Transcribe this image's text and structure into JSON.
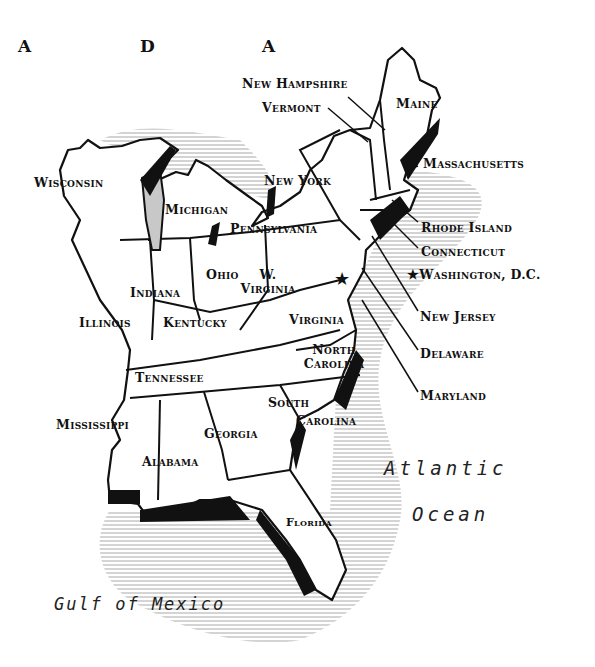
{
  "map": {
    "title_fragment": [
      "A",
      "D",
      "A"
    ],
    "states": {
      "maine": "Maine",
      "new_hampshire": "New Hampshire",
      "vermont": "Vermont",
      "massachusetts": "Massachusetts",
      "new_york": "New York",
      "rhode_island": "Rhode Island",
      "connecticut": "Connecticut",
      "new_jersey": "New Jersey",
      "delaware": "Delaware",
      "maryland": "Maryland",
      "pennsylvania": "Pennsylvania",
      "wisconsin": "Wisconsin",
      "michigan": "Michigan",
      "illinois": "Illinois",
      "indiana": "Indiana",
      "ohio": "Ohio",
      "west_virginia_line1": "W.",
      "west_virginia_line2": "Virginia",
      "virginia": "Virginia",
      "kentucky": "Kentucky",
      "tennessee": "Tennessee",
      "north_carolina_line1": "North",
      "north_carolina_line2": "Carolina",
      "south_carolina_line1": "South",
      "south_carolina_line2": "Carolina",
      "mississippi": "Mississippi",
      "alabama": "Alabama",
      "georgia": "Georgia",
      "florida": "Florida"
    },
    "capital": {
      "symbol": "★",
      "label": "Washington, D.C."
    },
    "water": {
      "atlantic_line1": "Atlantic",
      "atlantic_line2": "Ocean",
      "gulf": "Gulf of Mexico"
    },
    "colors": {
      "ink": "#111111",
      "water_shade": "#bdbdbd",
      "lake_fill": "#c8c8c8",
      "paper": "#ffffff"
    }
  }
}
